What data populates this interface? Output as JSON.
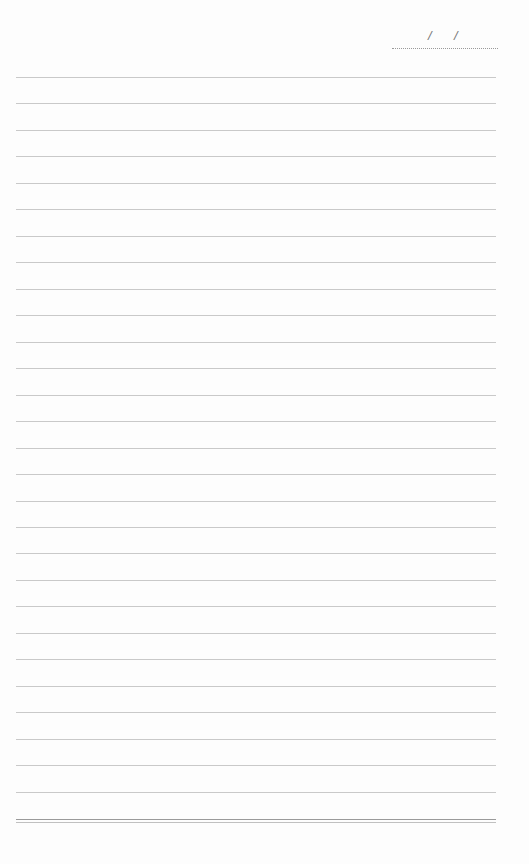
{
  "page": {
    "type": "lined-notebook-page",
    "background_color": "#fdfdfd",
    "line_color": "#c9c9c9",
    "date_field": {
      "separator_1": "/",
      "separator_2": "/",
      "value": ""
    },
    "ruled_lines": [
      77,
      103,
      130,
      156,
      183,
      209,
      236,
      262,
      289,
      315,
      342,
      368,
      395,
      421,
      448,
      474,
      501,
      527,
      553,
      580,
      606,
      633,
      659,
      686,
      712,
      739,
      765,
      792
    ],
    "bottom_rule_y": 819
  }
}
